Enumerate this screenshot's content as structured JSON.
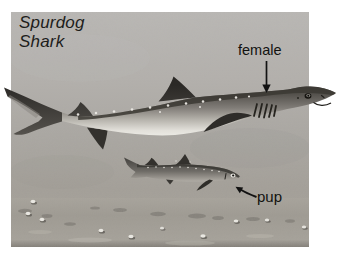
{
  "figure": {
    "title_line1": "Spurdog",
    "title_line2": "Shark",
    "labels": {
      "female": "female",
      "pup": "pup"
    },
    "colors": {
      "page_background": "#ffffff",
      "photo_gray_top": "#b9b7b4",
      "photo_gray_bottom": "#9b978f",
      "seafloor_gray": "#a09c94",
      "shark_dark": "#3b3833",
      "shark_belly": "#f0efea",
      "label_text": "#121210"
    }
  }
}
